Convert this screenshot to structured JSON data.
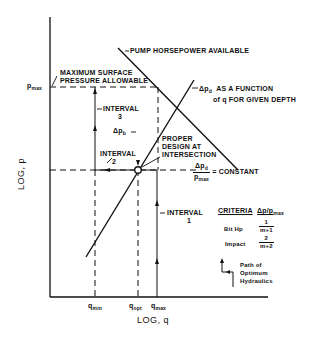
{
  "diagram": {
    "axes": {
      "x_label": "LOG, q",
      "y_label": "LOG, p",
      "x_ticks": [
        {
          "label": "q",
          "sub": "min"
        },
        {
          "label": "q",
          "sub": "opt"
        },
        {
          "label": "q",
          "sub": "max"
        }
      ],
      "y_ticks": [
        {
          "label": "p",
          "sub": "max"
        }
      ]
    },
    "annotations": {
      "pump_hp": "PUMP HORSEPOWER AVAILABLE",
      "max_pressure_line1": "MAXIMUM SURFACE",
      "max_pressure_line2": "PRESSURE ALLOWABLE",
      "dpd_function_sym": "Δp",
      "dpd_function_sub": "d",
      "dpd_function_line1": "AS A FUNCTION",
      "dpd_function_line2": "of q FOR GIVEN DEPTH",
      "interval3_line1": "INTERVAL",
      "interval3_line2": "3",
      "dpb_sym": "Δp",
      "dpb_sub": "b",
      "interval2_line1": "INTERVAL",
      "interval2_line2": "2",
      "interval1_line1": "INTERVAL",
      "interval1_line2": "1",
      "proper_design_line1": "PROPER",
      "proper_design_line2": "DESIGN AT",
      "proper_design_line3": "INTERSECTION",
      "ratio_num": "Δp",
      "ratio_num_sub": "d",
      "ratio_den": "p",
      "ratio_den_sub": "max",
      "ratio_suffix": "= CONSTANT"
    },
    "criteria_table": {
      "header_left": "CRITERIA",
      "header_right": "Δp/p",
      "header_right_sub": "max",
      "rows": [
        {
          "name": "Bit Hp",
          "num": "1",
          "den": "m+1"
        },
        {
          "name": "Impact",
          "num": "2",
          "den": "m+2"
        }
      ]
    },
    "legend": {
      "line1": "Path of",
      "line2": "Optimum",
      "line3": "Hydraulics"
    },
    "colors": {
      "ink": "#111111",
      "background": "#ffffff"
    }
  }
}
